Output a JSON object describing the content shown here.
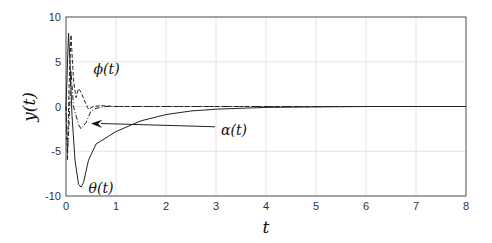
{
  "chart_data": {
    "type": "line",
    "title": "",
    "xlabel": "t",
    "ylabel": "y(t)",
    "xlim": [
      0,
      8
    ],
    "ylim": [
      -10,
      10
    ],
    "grid": true,
    "xticks": [
      "0",
      "1",
      "2",
      "3",
      "4",
      "5",
      "6",
      "7",
      "8"
    ],
    "yticks": [
      "10",
      "5",
      "0",
      "-5",
      "-10"
    ],
    "series": [
      {
        "name": "θ(t)",
        "style": "solid",
        "x": [
          0,
          0.05,
          0.08,
          0.12,
          0.18,
          0.25,
          0.3,
          0.35,
          0.45,
          0.6,
          0.8,
          1.0,
          1.5,
          2,
          2.5,
          3,
          4,
          5,
          6,
          8
        ],
        "y": [
          0,
          8.2,
          5,
          -1,
          -6,
          -8.7,
          -9,
          -8.5,
          -6,
          -4.2,
          -3.5,
          -2.8,
          -1.6,
          -0.9,
          -0.5,
          -0.3,
          -0.1,
          -0.05,
          0,
          0
        ]
      },
      {
        "name": "ϕ(t)",
        "style": "dashed",
        "x": [
          0,
          0.03,
          0.06,
          0.1,
          0.15,
          0.2,
          0.25,
          0.3,
          0.38,
          0.45,
          0.55,
          0.7,
          1,
          8
        ],
        "y": [
          0,
          -6,
          2,
          8,
          3,
          1,
          2,
          1.6,
          0.5,
          -0.3,
          0,
          0.1,
          0,
          0
        ]
      },
      {
        "name": "α(t)",
        "style": "dash-dot",
        "x": [
          0,
          0.03,
          0.06,
          0.1,
          0.15,
          0.2,
          0.25,
          0.3,
          0.4,
          0.5,
          0.6,
          0.8,
          1,
          8
        ],
        "y": [
          0,
          -5,
          -2,
          4,
          0,
          -1,
          -2,
          -2.5,
          -1.8,
          -0.5,
          -0.2,
          0,
          0,
          0
        ]
      }
    ],
    "annotations": [
      {
        "text": "ϕ(t)",
        "at": [
          0.55,
          4.2
        ]
      },
      {
        "text": "α(t)",
        "at": [
          3.1,
          -2.6
        ],
        "arrow_to": [
          0.5,
          -1.9
        ]
      },
      {
        "text": "θ(t)",
        "at": [
          0.45,
          -9.1
        ]
      }
    ]
  }
}
